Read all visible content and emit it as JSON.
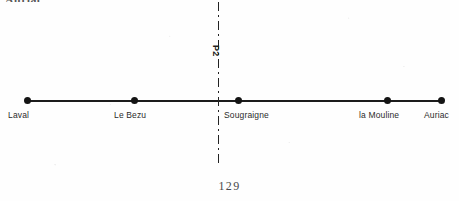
{
  "page": {
    "cut_off_heading": "Auriac.",
    "page_number": "129"
  },
  "figure": {
    "profile_line_label": "P2",
    "nodes": [
      {
        "label": "Laval",
        "x": 27,
        "label_x": 8
      },
      {
        "label": "Le Bezu",
        "x": 134,
        "label_x": 114
      },
      {
        "label": "Sougraigne",
        "x": 238,
        "label_x": 224
      },
      {
        "label": "la Mouline",
        "x": 387,
        "label_x": 359
      },
      {
        "label": "Auriac",
        "x": 441,
        "label_x": 424
      }
    ]
  }
}
